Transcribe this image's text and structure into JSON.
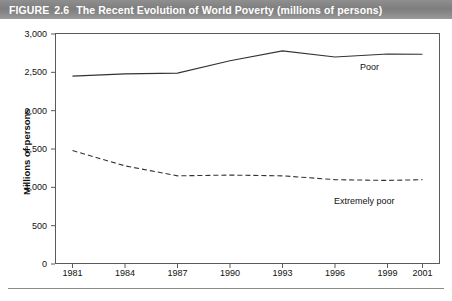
{
  "figure": {
    "label": "FIGURE",
    "number": "2.6",
    "title": "The Recent Evolution of World Poverty (millions of persons)",
    "header_color": "#808080",
    "text_color": "#111111"
  },
  "chart_data": {
    "type": "line",
    "title": "The Recent Evolution of World Poverty (millions of persons)",
    "xlabel": "",
    "ylabel": "Millions of persons",
    "x": [
      1981,
      1984,
      1987,
      1990,
      1993,
      1996,
      1999,
      2001
    ],
    "xlim": [
      1980,
      2002
    ],
    "ylim": [
      0,
      3000
    ],
    "ytick_values": [
      0,
      500,
      1000,
      1500,
      2000,
      2500,
      3000
    ],
    "ytick_labels": [
      "0",
      "500",
      "1,000",
      "1,500",
      "2,000",
      "2,500",
      "3,000"
    ],
    "xtick_labels": [
      "1981",
      "1984",
      "1987",
      "1990",
      "1993",
      "1996",
      "1999",
      "2001"
    ],
    "grid": false,
    "legend_position": "inline-labels",
    "series": [
      {
        "name": "Poor",
        "style": "solid",
        "color": "#333333",
        "values": [
          2450,
          2480,
          2490,
          2650,
          2780,
          2700,
          2740,
          2735
        ],
        "label": "Poor"
      },
      {
        "name": "Extremely poor",
        "style": "dashed",
        "color": "#333333",
        "values": [
          1480,
          1280,
          1150,
          1160,
          1150,
          1100,
          1090,
          1100
        ],
        "label": "Extremely poor"
      }
    ]
  }
}
